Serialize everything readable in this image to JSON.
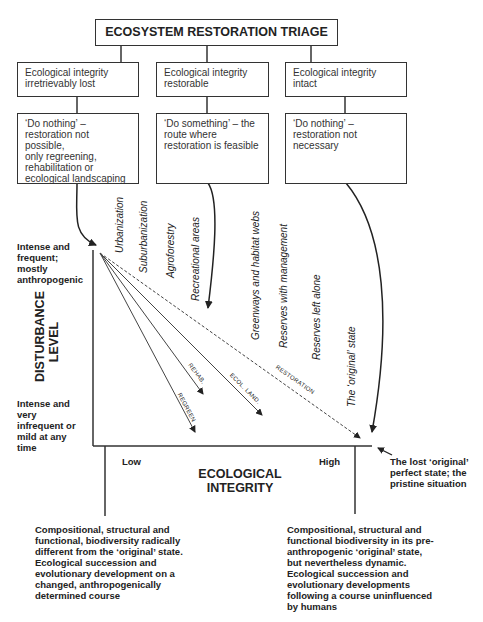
{
  "title": "ECOSYSTEM RESTORATION TRIAGE",
  "categories": [
    {
      "heading": "Ecological integrity irretrievably lost",
      "heading_lines": [
        "Ecological integrity",
        "irretrievably lost"
      ],
      "action_lines": [
        "‘Do nothing’ –",
        "restoration not possible,",
        "only regreening,",
        "rehabilitation or",
        "ecological landscaping"
      ]
    },
    {
      "heading": "Ecological integrity restorable",
      "heading_lines": [
        "Ecological integrity",
        "restorable"
      ],
      "action_lines": [
        "‘Do something’ – the",
        "route where",
        "restoration is feasible"
      ]
    },
    {
      "heading": "Ecological integrity intact",
      "heading_lines": [
        "Ecological integrity intact"
      ],
      "action_lines": [
        "‘Do nothing’ –",
        "restoration not",
        "necessary"
      ]
    }
  ],
  "land_uses": [
    "Urbanization",
    "Suburbanization",
    "Agroforestry",
    "Recreational areas",
    "Greenways and habitat webs",
    "Reserves with management",
    "Reserves left alone",
    "The ‘original’ state"
  ],
  "trajectories": [
    "REGREEN",
    "REHAB.",
    "ECOL. LAND.",
    "RESTORATION"
  ],
  "y_axis": {
    "title_lines": [
      "DISTURBANCE",
      "LEVEL"
    ],
    "top_note_lines": [
      "Intense and",
      "frequent;",
      "mostly",
      "anthropogenic"
    ],
    "bottom_note_lines": [
      "Intense and",
      "very",
      "infrequent or",
      "mild at any",
      "time"
    ]
  },
  "x_axis": {
    "title_lines": [
      "ECOLOGICAL",
      "INTEGRITY"
    ],
    "low_label": "Low",
    "high_label": "High"
  },
  "pristine_note_lines": [
    "The lost ‘original’",
    "perfect state; the",
    "pristine situation"
  ],
  "low_description_lines": [
    "Compositional, structural and",
    "functional, biodiversity radically",
    "different from the ‘original’ state.",
    "Ecological succession and",
    "evolutionary development on a",
    "changed, anthropogenically",
    "determined course"
  ],
  "high_description_lines": [
    "Compositional, structural and",
    "functional biodiversity in its pre-",
    "anthropogenic ‘original’ state,",
    "but nevertheless dynamic.",
    "Ecological succession and",
    "evolutionary developments",
    "following a course uninfluenced",
    "by humans"
  ]
}
